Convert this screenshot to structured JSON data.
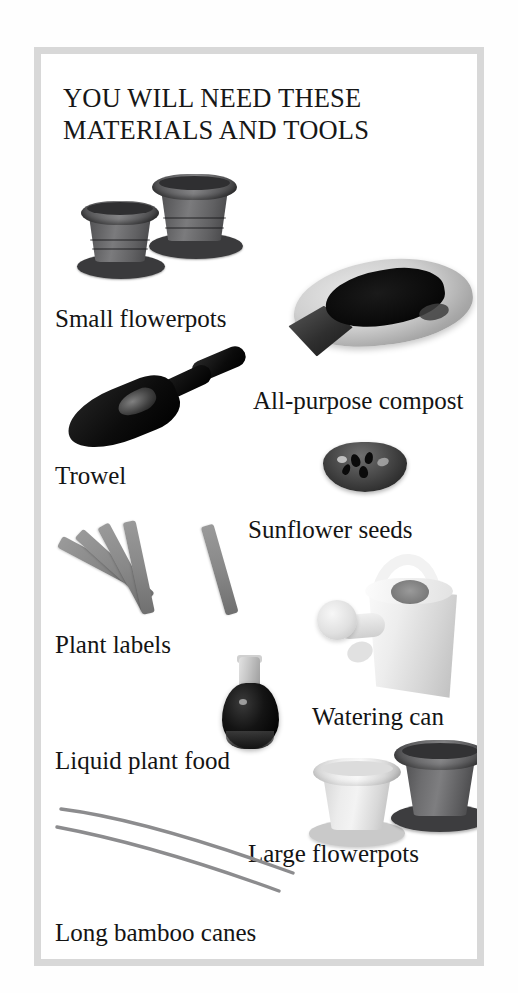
{
  "page": {
    "background_color": "#ffffff",
    "frame_border_color": "#d8d8d8"
  },
  "title": {
    "line1": "YOU WILL NEED THESE",
    "line2": "MATERIALS AND TOOLS"
  },
  "items": [
    {
      "id": "small-flowerpots",
      "caption": "Small flowerpots",
      "image": "two-small-dark-gray-plastic-flowerpots-with-saucers",
      "colors": {
        "pot": "#6b6b6d",
        "saucer": "#3a3a3c"
      }
    },
    {
      "id": "all-purpose-compost",
      "caption": "All-purpose compost",
      "image": "open-bag-of-dark-compost",
      "colors": {
        "bag": "#cfcfcf",
        "compost": "#0b0b0b"
      }
    },
    {
      "id": "trowel",
      "caption": "Trowel",
      "image": "black-garden-trowel",
      "colors": {
        "metal": "#121212"
      }
    },
    {
      "id": "sunflower-seeds",
      "caption": "Sunflower seeds",
      "image": "small-dark-dish-of-sunflower-seeds",
      "colors": {
        "dish": "#3a3a3a",
        "seed": "#0a0a0a"
      }
    },
    {
      "id": "plant-labels",
      "caption": "Plant labels",
      "image": "five-gray-plastic-plant-label-sticks-fanned-out",
      "colors": {
        "label": "#888888"
      }
    },
    {
      "id": "watering-can",
      "caption": "Watering can",
      "image": "white-watering-can-with-handle-and-rose-spout",
      "colors": {
        "can": "#ededed",
        "rose": "#d8d8d8"
      }
    },
    {
      "id": "liquid-plant-food",
      "caption": "Liquid plant food",
      "image": "small-dark-bottle-of-liquid-plant-food",
      "colors": {
        "bottle": "#0d0d0d",
        "neck": "#c4c4c4"
      }
    },
    {
      "id": "large-flowerpots",
      "caption": "Large flowerpots",
      "image": "one-light-gray-and-one-dark-gray-large-flowerpot-with-saucers",
      "colors": {
        "light_pot": "#ececec",
        "dark_pot": "#6d6d6f"
      }
    },
    {
      "id": "long-bamboo-canes",
      "caption": "Long bamboo canes",
      "image": "two-long-thin-gray-bamboo-canes-lying-diagonally",
      "colors": {
        "cane": "#8e8e90"
      }
    }
  ]
}
